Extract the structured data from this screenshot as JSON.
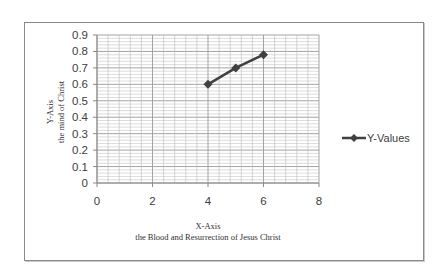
{
  "chart_data": {
    "type": "line",
    "title": "",
    "xlabel": "X-Axis",
    "xlabel_sub": "the Blood and Resurrection of Jesus Christ",
    "ylabel": "Y-Axis",
    "ylabel_sub": "the mind of Christ",
    "xlim": [
      0,
      8
    ],
    "ylim": [
      0,
      0.9
    ],
    "xticks": [
      "0",
      "2",
      "4",
      "6",
      "8"
    ],
    "yticks": [
      "0",
      "0.1",
      "0.2",
      "0.3",
      "0.4",
      "0.5",
      "0.6",
      "0.7",
      "0.8",
      "0.9"
    ],
    "grid": true,
    "legend_position": "right",
    "series": [
      {
        "name": "Y-Values",
        "x": [
          4,
          5,
          6
        ],
        "values": [
          0.6,
          0.7,
          0.78
        ],
        "color": "#404040",
        "marker": "diamond"
      }
    ]
  },
  "colors": {
    "line": "#404040",
    "grid": "#b8b8b8",
    "frame": "#8a8a8a"
  }
}
